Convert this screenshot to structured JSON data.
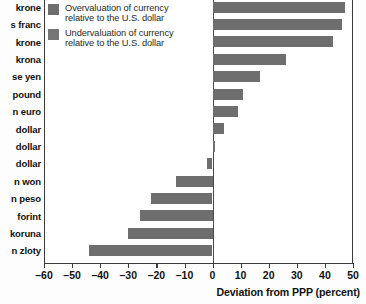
{
  "chart_data": {
    "type": "bar",
    "orientation": "horizontal",
    "title": "",
    "xlabel": "Deviation from PPP (percent)",
    "ylabel": "",
    "xlim": [
      -60,
      50
    ],
    "xticks": [
      -60,
      -50,
      -40,
      -30,
      -20,
      -10,
      0,
      10,
      20,
      30,
      40,
      50
    ],
    "xticklabels": [
      "–60",
      "–50",
      "–40",
      "–30",
      "–20",
      "–10",
      "0",
      "10",
      "20",
      "30",
      "40",
      "50"
    ],
    "grid": false,
    "legend_position": "top-left",
    "categories": [
      "krone",
      "s franc",
      "krone",
      "krona",
      "se yen",
      "pound",
      "n euro",
      "dollar",
      "dollar",
      "dollar",
      "n won",
      "n peso",
      "forint",
      "koruna",
      "n zloty"
    ],
    "values": [
      47,
      46,
      43,
      26,
      17,
      11,
      9,
      4,
      1,
      -2,
      -13,
      -22,
      -26,
      -30,
      -44
    ],
    "series": [
      {
        "name": "Overvaluation of currency relative to the U.S. dollar",
        "color": "#6e6e6e"
      },
      {
        "name": "Undervaluation of currency relative to the U.S. dollar",
        "color": "#6e6e6e"
      }
    ]
  },
  "legend": {
    "items": [
      {
        "line1": "Overvaluation of currency",
        "line2": "relative to the U.S. dollar"
      },
      {
        "line1": "Undervaluation of currency",
        "line2": "relative to the U.S. dollar"
      }
    ]
  },
  "axis": {
    "title": "Deviation from PPP (percent)"
  }
}
